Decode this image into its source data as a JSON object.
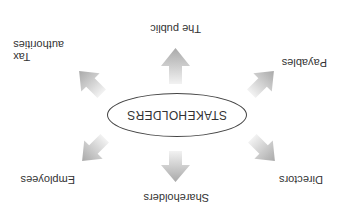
{
  "diagram": {
    "orientation": "rotated 180 degrees",
    "center": {
      "label": "STAKEHOLDERS"
    },
    "nodes": [
      {
        "id": "shareholders",
        "label": "Shareholders",
        "direction": "up"
      },
      {
        "id": "employees",
        "label": "Employees",
        "direction": "up-right"
      },
      {
        "id": "directors",
        "label": "Directors",
        "direction": "up-left"
      },
      {
        "id": "tax-authorities",
        "label_line1": "Tax",
        "label_line2": "authorities",
        "direction": "down-right"
      },
      {
        "id": "payables",
        "label": "Payables",
        "direction": "down-left"
      },
      {
        "id": "the-public",
        "label": "The public",
        "direction": "down"
      }
    ],
    "colors": {
      "arrow_light": "#e6e6e6",
      "arrow_dark": "#a8a8a8",
      "ellipse_border": "#444444",
      "text": "#333333"
    }
  }
}
